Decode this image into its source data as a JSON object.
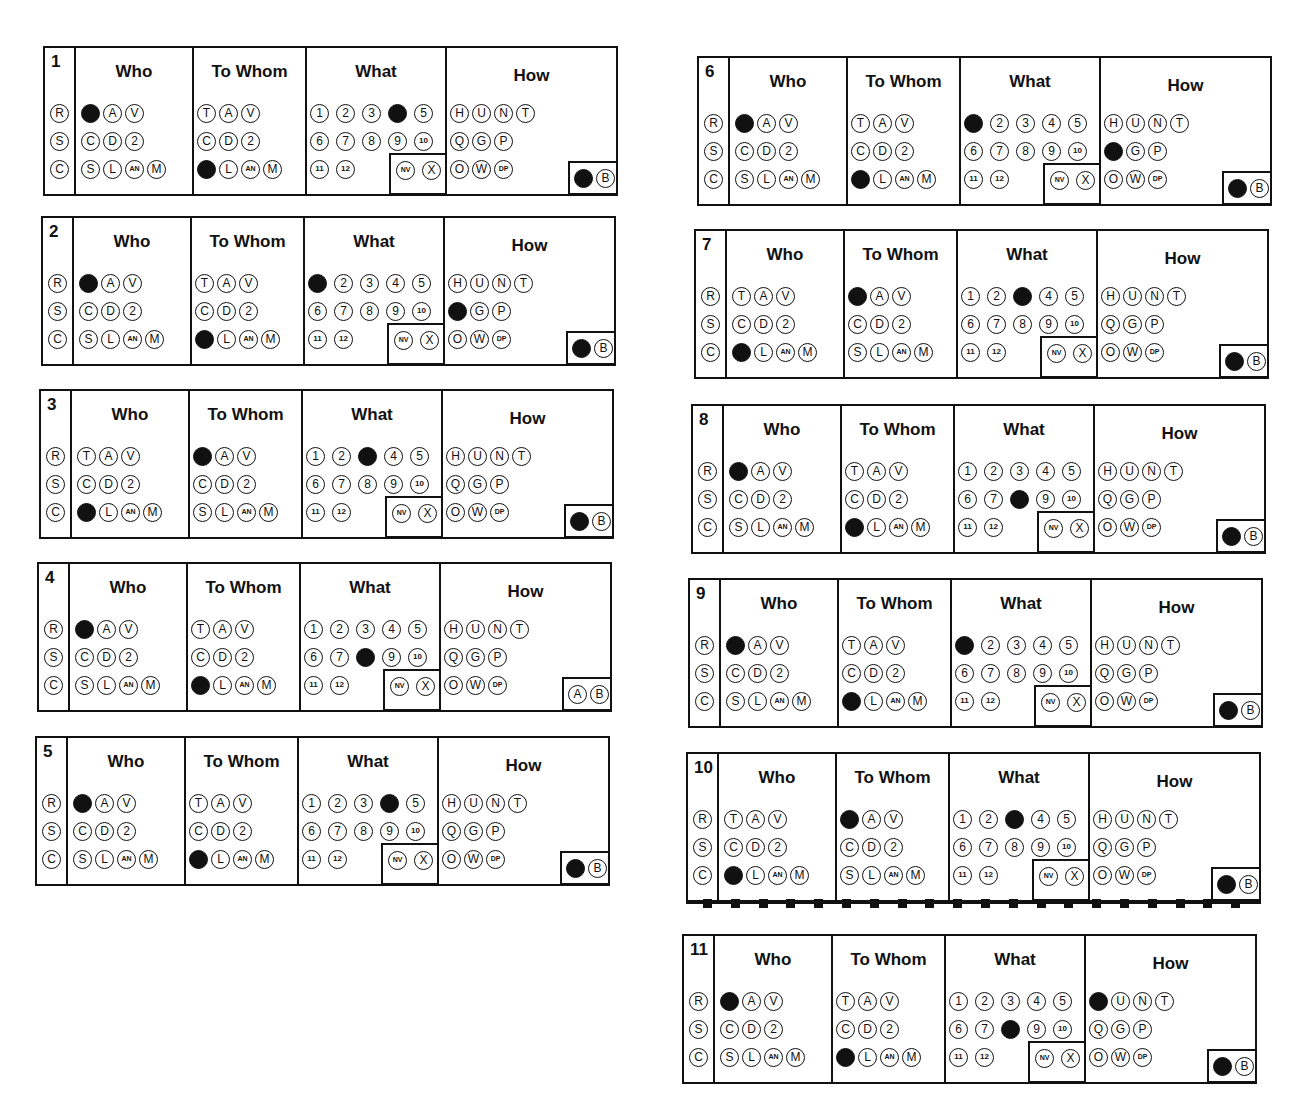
{
  "section_labels": {
    "who": "Who",
    "to_whom": "To Whom",
    "what": "What",
    "how": "How"
  },
  "options": {
    "row_prefix": [
      "R",
      "S",
      "C"
    ],
    "who": [
      [
        "T",
        "A",
        "V"
      ],
      [
        "C",
        "D",
        "2"
      ],
      [
        "S",
        "L",
        "AN",
        "M"
      ]
    ],
    "to_whom": [
      [
        "T",
        "A",
        "V"
      ],
      [
        "C",
        "D",
        "2"
      ],
      [
        "S",
        "L",
        "AN",
        "M"
      ]
    ],
    "what": [
      [
        "1",
        "2",
        "3",
        "4",
        "5"
      ],
      [
        "6",
        "7",
        "8",
        "9",
        "10"
      ],
      [
        "11",
        "12"
      ]
    ],
    "what_box": [
      "NV",
      "X"
    ],
    "how": [
      [
        "H",
        "U",
        "N",
        "T"
      ],
      [
        "Q",
        "G",
        "P"
      ],
      [
        "O",
        "W",
        "DP"
      ]
    ],
    "ab_box": [
      "A",
      "B"
    ]
  },
  "forms": [
    {
      "number": "1",
      "who": "T",
      "who_row": 0,
      "to_whom": "S",
      "to_whom_row": 2,
      "what": "4",
      "how": null,
      "ab": "A"
    },
    {
      "number": "2",
      "who": "T",
      "who_row": 0,
      "to_whom": "S",
      "to_whom_row": 2,
      "what": "1",
      "how": "Q",
      "ab": "A"
    },
    {
      "number": "3",
      "who": "S",
      "who_row": 2,
      "to_whom": "T",
      "to_whom_row": 0,
      "what": "3",
      "how": null,
      "ab": "A"
    },
    {
      "number": "4",
      "who": "T",
      "who_row": 0,
      "to_whom": "S",
      "to_whom_row": 2,
      "what": "8",
      "how": null,
      "ab": null
    },
    {
      "number": "5",
      "who": "T",
      "who_row": 0,
      "to_whom": "S",
      "to_whom_row": 2,
      "what": "4",
      "how": null,
      "ab": "A"
    },
    {
      "number": "6",
      "who": "T",
      "who_row": 0,
      "to_whom": "S",
      "to_whom_row": 2,
      "what": "1",
      "how": "Q",
      "ab": "A"
    },
    {
      "number": "7",
      "who": "S",
      "who_row": 2,
      "to_whom": "T",
      "to_whom_row": 0,
      "what": "3",
      "how": null,
      "ab": "A"
    },
    {
      "number": "8",
      "who": "T",
      "who_row": 0,
      "to_whom": "S",
      "to_whom_row": 2,
      "what": "8",
      "how": null,
      "ab": "A"
    },
    {
      "number": "9",
      "who": "T",
      "who_row": 0,
      "to_whom": "S",
      "to_whom_row": 2,
      "what": "1",
      "how": null,
      "ab": "A"
    },
    {
      "number": "10",
      "who": "S",
      "who_row": 2,
      "to_whom": "T",
      "to_whom_row": 0,
      "what": "3",
      "how": null,
      "ab": "A",
      "timing_marks": 20
    },
    {
      "number": "11",
      "who": "T",
      "who_row": 0,
      "to_whom": "S",
      "to_whom_row": 2,
      "what": "8",
      "how": "H",
      "ab": "A"
    }
  ]
}
